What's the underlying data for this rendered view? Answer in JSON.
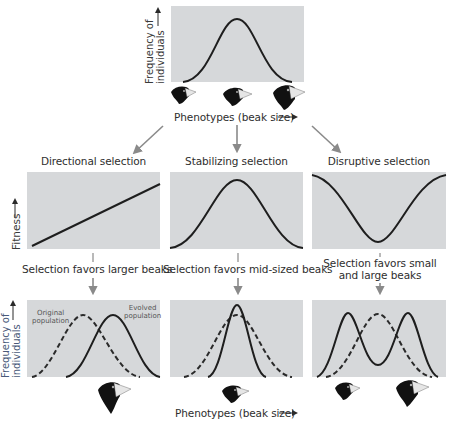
{
  "top": {
    "y_axis_label_line1": "Frequency of",
    "y_axis_label_line2": "individuals",
    "x_axis_label": "Phenotypes (beak size)",
    "curve": "normal-distribution",
    "beak_icons": [
      "small-beak-finch",
      "medium-beak-finch",
      "large-beak-finch"
    ]
  },
  "selection_types": [
    {
      "title": "Directional selection",
      "fitness_curve": "increasing-line",
      "caption_line1": "Selection favors larger beaks",
      "caption_line2": "",
      "bottom_labels": {
        "original": [
          "Original",
          "population"
        ],
        "evolved": [
          "Evolved",
          "population"
        ]
      },
      "beak_icons": [
        "large-beak-finch"
      ]
    },
    {
      "title": "Stabilizing selection",
      "fitness_curve": "bell-peak",
      "caption_line1": "Selection favors mid-sized beaks",
      "caption_line2": "",
      "beak_icons": [
        "medium-beak-finch"
      ]
    },
    {
      "title": "Disruptive selection",
      "fitness_curve": "u-shaped",
      "caption_line1": "Selection favors small",
      "caption_line2": "and large beaks",
      "beak_icons": [
        "small-beak-finch",
        "large-beak-finch"
      ]
    }
  ],
  "fitness_axis_label": "Fitness",
  "bottom": {
    "y_axis_label_line1": "Frequency of",
    "y_axis_label_line2": "individuals",
    "x_axis_label": "Phenotypes (beak size)"
  },
  "colors": {
    "panel_bg": "#d6d8da",
    "curve": "#1e1e1e",
    "arrow": "#8a8a8a",
    "bird_body": "#111111",
    "beak": "#e8e8e8"
  }
}
